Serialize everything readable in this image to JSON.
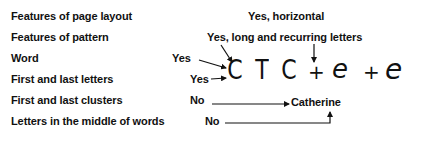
{
  "rows": [
    {
      "label": "Features of page layout",
      "answer": "Yes, horizontal"
    },
    {
      "label": "Features of pattern",
      "answer": "Yes, long and recurring letters"
    },
    {
      "label": "Word",
      "answer": "Yes"
    },
    {
      "label": "First and last letters",
      "answer": "Yes"
    },
    {
      "label": "First and last clusters",
      "answer": "No"
    },
    {
      "label": "Letters in the middle of words",
      "answer": "No"
    }
  ],
  "handwriting": {
    "c1": "C",
    "t": "T",
    "c2": "C",
    "plus1": "+",
    "e1": "e",
    "plus2": "+",
    "e2": "e"
  },
  "target_word": "Catherine"
}
